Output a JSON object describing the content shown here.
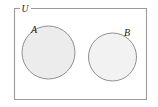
{
  "diagram": {
    "type": "venn-diagram",
    "universe": {
      "label": "U",
      "shape": "rectangle",
      "x": 14,
      "y": 8,
      "width": 133,
      "height": 92,
      "stroke_color": "#9a9a9a",
      "fill_color": "#ffffff",
      "stroke_width": 1.1,
      "label_x": 25,
      "label_y": 11.5,
      "label_gap_start": 20,
      "label_gap_end": 31
    },
    "sets": [
      {
        "label": "A",
        "shape": "circle",
        "cx": 48.5,
        "cy": 52.5,
        "r": 26.5,
        "fill_color": "#ececec",
        "stroke_color": "#8f8f8f",
        "stroke_width": 1.0,
        "label_x": 31,
        "label_y": 33
      },
      {
        "label": "B",
        "shape": "circle",
        "cx": 112.5,
        "cy": 57.0,
        "r": 24.0,
        "fill_color": "#f2f2f2",
        "stroke_color": "#8f8f8f",
        "stroke_width": 1.0,
        "label_x": 124,
        "label_y": 36
      }
    ],
    "relation": "disjoint"
  },
  "colors": {
    "background": "#ffffff",
    "border": "#9a9a9a",
    "circle_stroke": "#8f8f8f",
    "circle_a_fill": "#ececec",
    "circle_b_fill": "#f2f2f2",
    "text": "#1a1a1a"
  }
}
